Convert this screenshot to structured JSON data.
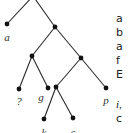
{
  "diagram": {
    "type": "binary-tree",
    "colors": {
      "edge": "#2a2a2a",
      "node": "#111111",
      "label": "#333333"
    },
    "nodes": [
      {
        "id": "root",
        "x": 33,
        "y": -4,
        "kind": "internal"
      },
      {
        "id": "a",
        "x": 7,
        "y": 24,
        "kind": "leaf",
        "label": "a"
      },
      {
        "id": "n1",
        "x": 55,
        "y": 27,
        "kind": "internal"
      },
      {
        "id": "n2",
        "x": 32,
        "y": 56,
        "kind": "internal"
      },
      {
        "id": "n3",
        "x": 81,
        "y": 58,
        "kind": "internal"
      },
      {
        "id": "q",
        "x": 19,
        "y": 89,
        "kind": "leaf",
        "label": "?"
      },
      {
        "id": "g",
        "x": 48,
        "y": 88,
        "kind": "leaf",
        "label": "g"
      },
      {
        "id": "n4",
        "x": 56,
        "y": 87,
        "kind": "internal"
      },
      {
        "id": "k",
        "x": 44,
        "y": 119,
        "kind": "leaf",
        "label": "k"
      },
      {
        "id": "c",
        "x": 73,
        "y": 118,
        "kind": "leaf",
        "label": "c"
      },
      {
        "id": "p",
        "x": 106,
        "y": 88,
        "kind": "leaf",
        "label": "p"
      }
    ],
    "edges": [
      [
        "root",
        "a"
      ],
      [
        "root",
        "n1"
      ],
      [
        "n1",
        "n2"
      ],
      [
        "n1",
        "n3"
      ],
      [
        "n2",
        "q"
      ],
      [
        "n2",
        "g"
      ],
      [
        "n3",
        "n4"
      ],
      [
        "n3",
        "p"
      ],
      [
        "n4",
        "k"
      ],
      [
        "n4",
        "c"
      ]
    ],
    "labels": {
      "a": "a",
      "q": "?",
      "g": "g",
      "k": "k",
      "c": "c",
      "p": "p"
    }
  },
  "side_text": {
    "lines": [
      "a",
      "b",
      "a",
      "f",
      "E",
      "i,",
      "c"
    ]
  }
}
